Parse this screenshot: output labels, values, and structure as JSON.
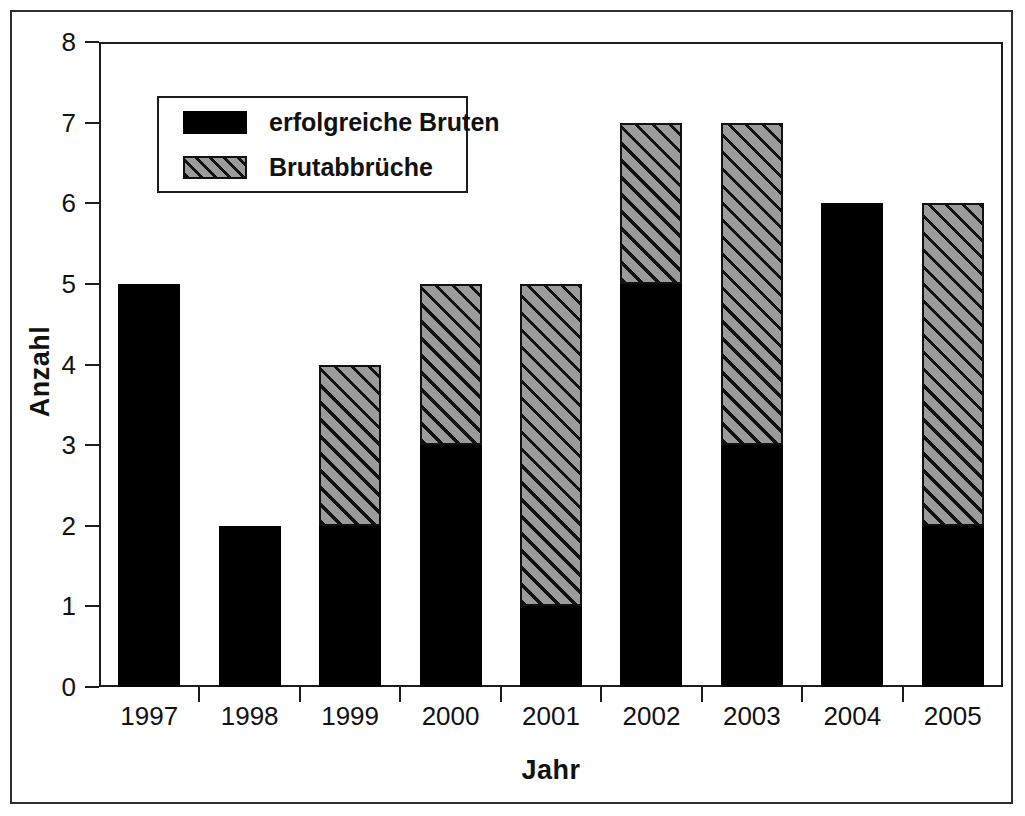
{
  "figure": {
    "has_outer_border": true
  },
  "chart_data": {
    "type": "bar",
    "subtype": "stacked",
    "title": "",
    "xlabel": "Jahr",
    "ylabel": "Anzahl",
    "categories": [
      "1997",
      "1998",
      "1999",
      "2000",
      "2001",
      "2002",
      "2003",
      "2004",
      "2005"
    ],
    "series": [
      {
        "name": "erfolgreiche Bruten",
        "fill": "solid-black",
        "color": "#000000",
        "values": [
          5,
          2,
          2,
          3,
          1,
          5,
          3,
          6,
          2
        ]
      },
      {
        "name": "Brutabbrüche",
        "fill": "gray-diagonal-hatch",
        "color": "#9b9b9b",
        "values": [
          0,
          0,
          2,
          2,
          4,
          2,
          4,
          0,
          4
        ]
      }
    ],
    "totals": [
      5,
      2,
      4,
      5,
      5,
      7,
      7,
      6,
      6
    ],
    "ylim": [
      0,
      8
    ],
    "yticks": [
      "0",
      "1",
      "2",
      "3",
      "4",
      "5",
      "6",
      "7",
      "8"
    ],
    "grid": false,
    "legend_position": "upper-left-inside"
  },
  "legend": {
    "entries": [
      {
        "label": "erfolgreiche Bruten",
        "swatch": "solid"
      },
      {
        "label": "Brutabbrüche",
        "swatch": "hatch"
      }
    ]
  },
  "axes": {
    "y_title": "Anzahl",
    "x_title": "Jahr"
  }
}
